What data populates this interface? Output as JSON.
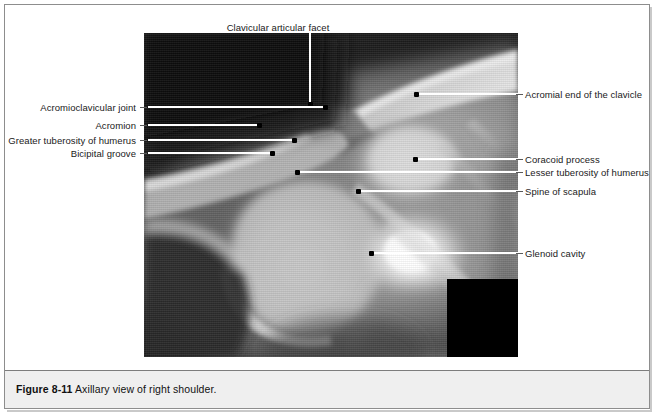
{
  "figure": {
    "number": "Figure 8-11",
    "caption": "Axillary view of right shoulder.",
    "modality": "radiograph",
    "view": "axillary",
    "side": "right",
    "region": "shoulder"
  },
  "labels_top": [
    {
      "id": "clavicular-articular-facet",
      "text": "Clavicular articular facet",
      "text_x": 278,
      "text_y": 22,
      "line": {
        "x": 309,
        "y_top": 30,
        "y_bottom": 104
      },
      "dot": {
        "x": 309,
        "y": 104
      }
    }
  ],
  "labels_left": [
    {
      "id": "acromioclavicular-joint",
      "text": "Acromioclavicular joint",
      "text_right": 136,
      "y": 107,
      "dash": {
        "x": 140,
        "w": 7
      },
      "line": {
        "x1": 148,
        "x2": 325
      },
      "dot": {
        "x": 325,
        "y": 107
      }
    },
    {
      "id": "acromion",
      "text": "Acromion",
      "text_right": 136,
      "y": 125,
      "dash": {
        "x": 140,
        "w": 7
      },
      "line": {
        "x1": 148,
        "x2": 259
      },
      "dot": {
        "x": 259,
        "y": 125
      }
    },
    {
      "id": "greater-tuberosity-of-humerus",
      "text": "Greater tuberosity of humerus",
      "text_right": 136,
      "y": 140,
      "dash": {
        "x": 140,
        "w": 7
      },
      "line": {
        "x1": 148,
        "x2": 294
      },
      "dot": {
        "x": 294,
        "y": 140
      }
    },
    {
      "id": "bicipital-groove",
      "text": "Bicipital groove",
      "text_right": 136,
      "y": 153,
      "dash": {
        "x": 140,
        "w": 7
      },
      "line": {
        "x1": 148,
        "x2": 272
      },
      "dot": {
        "x": 272,
        "y": 153
      }
    }
  ],
  "labels_right": [
    {
      "id": "acromial-end-of-the-clavicle",
      "text": "Acromial end of the clavicle",
      "text_left": 525,
      "y": 94,
      "dash": {
        "x": 516,
        "w": 7
      },
      "line": {
        "x1": 416,
        "x2": 518
      },
      "dot": {
        "x": 416,
        "y": 94
      }
    },
    {
      "id": "coracoid-process",
      "text": "Coracoid process",
      "text_left": 525,
      "y": 159,
      "dash": {
        "x": 516,
        "w": 7
      },
      "line": {
        "x1": 415,
        "x2": 518
      },
      "dot": {
        "x": 415,
        "y": 159
      }
    },
    {
      "id": "lesser-tuberosity-of-humerus",
      "text": "Lesser tuberosity of humerus",
      "text_left": 525,
      "y": 172,
      "dash": {
        "x": 516,
        "w": 7
      },
      "line": {
        "x1": 297,
        "x2": 518
      },
      "dot": {
        "x": 297,
        "y": 172
      }
    },
    {
      "id": "spine-of-scapula",
      "text": "Spine of scapula",
      "text_left": 525,
      "y": 191,
      "dash": {
        "x": 516,
        "w": 7
      },
      "line": {
        "x1": 358,
        "x2": 518
      },
      "dot": {
        "x": 358,
        "y": 191
      }
    },
    {
      "id": "glenoid-cavity",
      "text": "Glenoid cavity",
      "text_left": 525,
      "y": 253,
      "dash": {
        "x": 516,
        "w": 7
      },
      "line": {
        "x1": 371,
        "x2": 518
      },
      "dot": {
        "x": 371,
        "y": 253
      }
    }
  ],
  "colors": {
    "page_background": "#ffffff",
    "frame_border": "#8d8d8d",
    "caption_band": "#efefef",
    "caption_text": "#111111",
    "label_text": "#1a1a1a",
    "leader_line": "#ffffff",
    "leader_dash": "#5a5a5a",
    "dot": "#000000",
    "xray_dark": "#1d1d1d",
    "xray_mid": "#8a8a8a",
    "xray_bright": "#f2f2f2",
    "inset_block": "#000000"
  }
}
